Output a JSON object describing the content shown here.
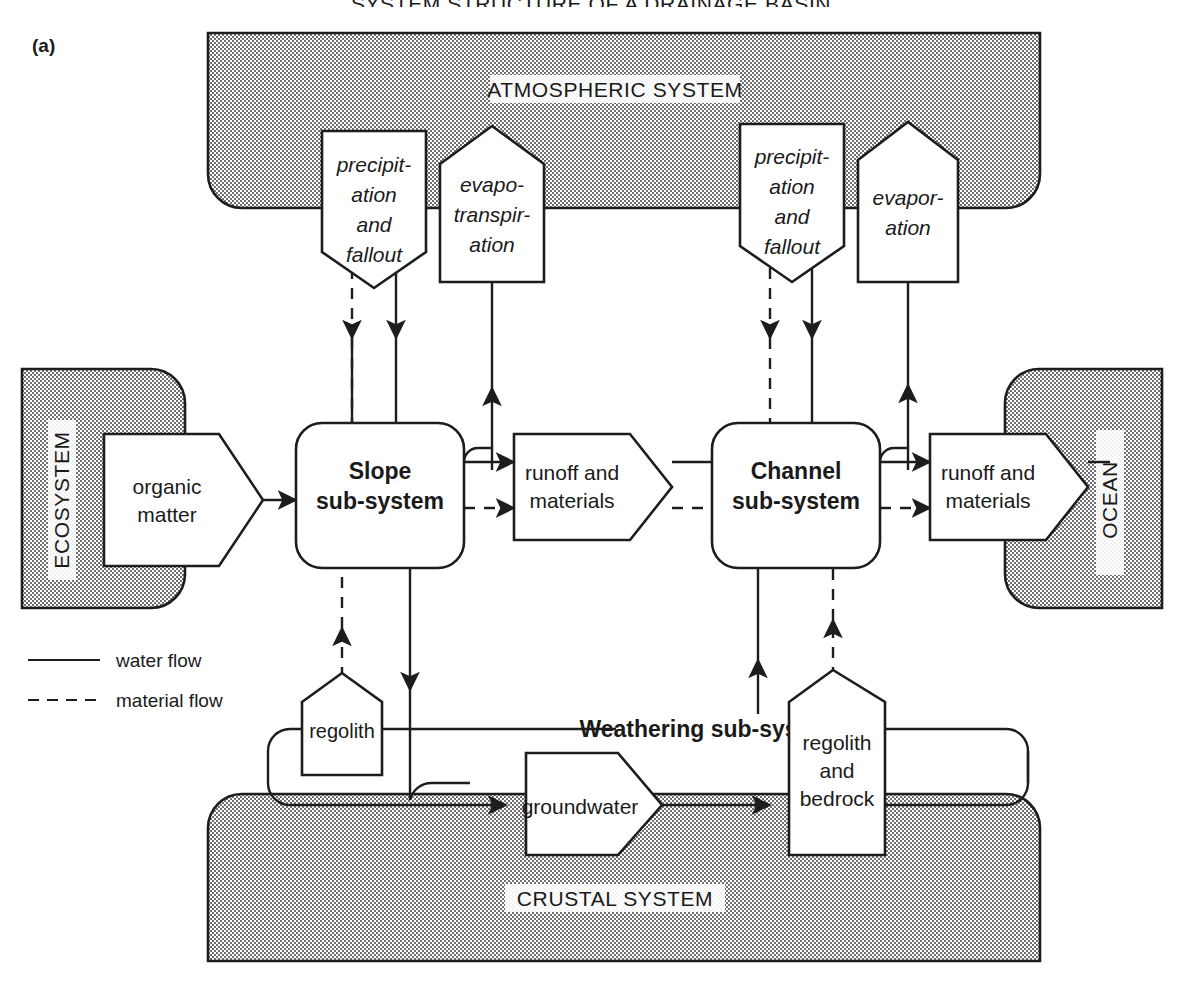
{
  "figure": {
    "panel_label": "(a)",
    "top_title": "SYSTEM STRUCTURE OF A DRAINAGE BASIN"
  },
  "environments": {
    "atmospheric": "ATMOSPHERIC SYSTEM",
    "crustal": "CRUSTAL SYSTEM",
    "ecosystem": "ECOSYSTEM",
    "ocean": "OCEAN"
  },
  "subsystems": {
    "slope": "Slope\nsub-system",
    "slope_line1": "Slope",
    "slope_line2": "sub-system",
    "channel_line1": "Channel",
    "channel_line2": "sub-system",
    "weathering": "Weathering sub-system"
  },
  "flux_boxes": {
    "precip_left_l1": "precipit-",
    "precip_left_l2": "ation",
    "precip_left_l3": "and",
    "precip_left_l4": "fallout",
    "evapotrans_l1": "evapo-",
    "evapotrans_l2": "transpir-",
    "evapotrans_l3": "ation",
    "precip_right_l1": "precipit-",
    "precip_right_l2": "ation",
    "precip_right_l3": "and",
    "precip_right_l4": "fallout",
    "evap_right_l1": "evapor-",
    "evap_right_l2": "ation",
    "organic_l1": "organic",
    "organic_l2": "matter",
    "runoff_left_l1": "runoff and",
    "runoff_left_l2": "materials",
    "runoff_right_l1": "runoff and",
    "runoff_right_l2": "materials",
    "regolith": "regolith",
    "groundwater": "groundwater",
    "regolith_bedrock_l1": "regolith",
    "regolith_bedrock_l2": "and",
    "regolith_bedrock_l3": "bedrock"
  },
  "legend": {
    "water_flow": "water flow",
    "material_flow": "material flow"
  },
  "colors": {
    "ink": "#1d1d1d",
    "paper": "#ffffff",
    "stipple": "#6e6e6e"
  }
}
